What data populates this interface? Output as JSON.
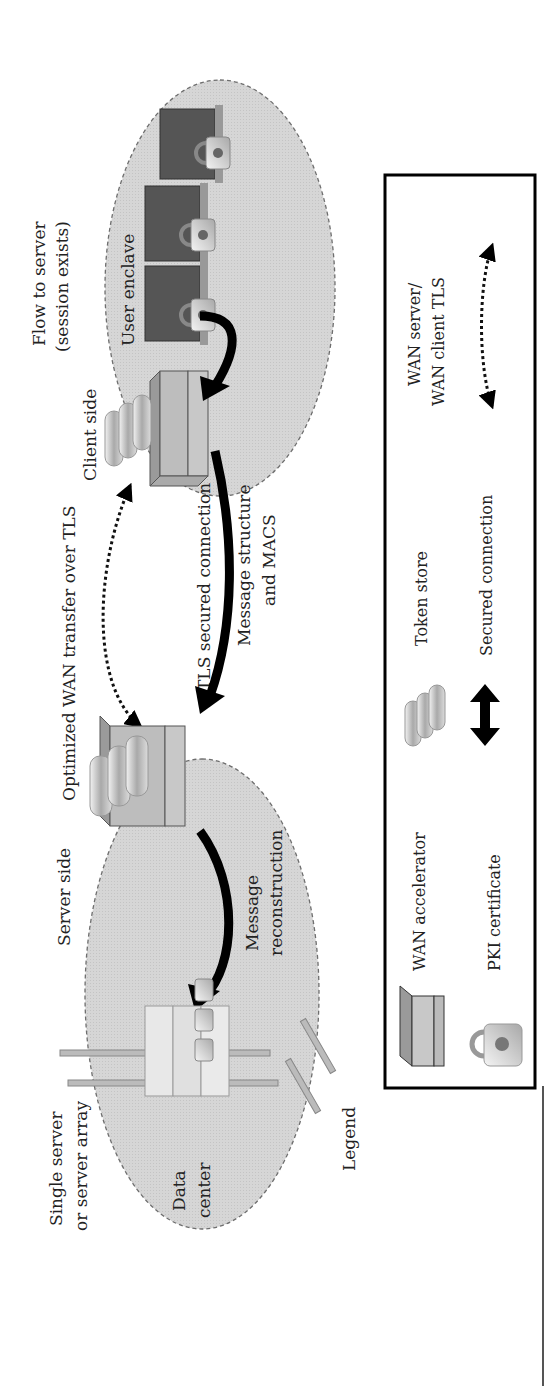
{
  "diagram": {
    "type": "network-architecture",
    "orientation": "rotated-90-ccw",
    "labels": {
      "flow_to_server_1": "Flow to server",
      "flow_to_server_2": "(session exists)",
      "user_enclave": "User enclave",
      "client_side": "Client side",
      "optimized_wan": "Optimized WAN transfer over TLS",
      "tls_secured": "TLS secured connection",
      "msg_structure_1": "Message structure",
      "msg_structure_2": "and  MACS",
      "server_side": "Server side",
      "msg_recon_1": "Message",
      "msg_recon_2": "reconstruction",
      "single_server_1": "Single server",
      "single_server_2": "or server array",
      "data_center_1": "Data",
      "data_center_2": "center",
      "legend_title": "Legend"
    },
    "zones": [
      {
        "id": "user-enclave",
        "label": "User enclave"
      },
      {
        "id": "data-center",
        "label": "Data center"
      }
    ],
    "legend": {
      "items": [
        {
          "icon": "wan-accelerator-icon",
          "label": "WAN accelerator"
        },
        {
          "icon": "pki-certificate-icon",
          "label": "PKI certificate"
        },
        {
          "icon": "token-store-icon",
          "label": "Token store"
        },
        {
          "icon": "secured-connection-arrow-icon",
          "label": "Secured connection"
        },
        {
          "icon": "dotted-arrow-icon",
          "label_1": "WAN server/",
          "label_2": "WAN client TLS"
        }
      ]
    },
    "colors": {
      "zone_fill": "#d4d4d4",
      "zone_stroke": "#777777",
      "arrow": "#000000",
      "device_fill": "#bdbdbd",
      "legend_border": "#000000"
    }
  }
}
